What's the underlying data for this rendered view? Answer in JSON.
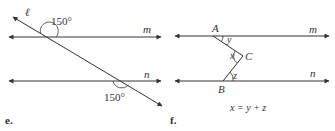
{
  "figures": [
    {
      "id": "e",
      "label": "e.",
      "lines": {
        "transversal": "ℓ",
        "top_parallel": "m",
        "bottom_parallel": "n"
      },
      "angles": [
        {
          "label": "150°",
          "position": "above line m, left of transversal"
        },
        {
          "label": "150°",
          "position": "below line n, left of transversal"
        }
      ]
    },
    {
      "id": "f",
      "label": "f.",
      "lines": {
        "top_parallel": "m",
        "bottom_parallel": "n"
      },
      "points": [
        "A",
        "B",
        "C"
      ],
      "angles": [
        {
          "label": "y",
          "vertex": "A"
        },
        {
          "label": "x",
          "vertex": "C"
        },
        {
          "label": "z",
          "vertex": "B"
        }
      ],
      "equation": "x = y + z"
    }
  ],
  "colors": {
    "line": "#333333",
    "text": "#333333",
    "background": "#ffffff"
  }
}
